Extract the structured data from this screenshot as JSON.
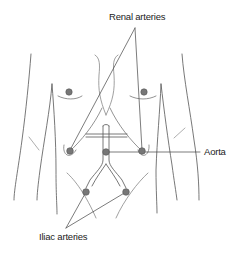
{
  "diagram": {
    "type": "anatomical-illustration",
    "labels": {
      "renal": "Renal arteries",
      "aorta": "Aorta",
      "iliac": "Iliac arteries"
    },
    "points": [
      {
        "name": "left-nipple",
        "x": 69,
        "y": 92
      },
      {
        "name": "right-nipple",
        "x": 144,
        "y": 92
      },
      {
        "name": "left-renal-artery",
        "x": 70,
        "y": 150
      },
      {
        "name": "aorta",
        "x": 106,
        "y": 152
      },
      {
        "name": "right-renal-artery",
        "x": 142,
        "y": 150
      },
      {
        "name": "left-iliac-artery",
        "x": 86,
        "y": 192
      },
      {
        "name": "right-iliac-artery",
        "x": 126,
        "y": 192
      }
    ],
    "colors": {
      "line": "#555555",
      "dot": "#777777",
      "dot_stroke": "#555555",
      "text": "#222222"
    }
  }
}
